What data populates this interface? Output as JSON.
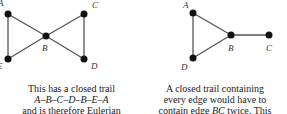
{
  "left_graph": {
    "vertices": [
      {
        "id": "A",
        "x": 8,
        "y": 14,
        "label_x": -2,
        "label_y": 6
      },
      {
        "id": "C",
        "x": 84,
        "y": 14,
        "label_x": 92,
        "label_y": 8
      },
      {
        "id": "B",
        "x": 46,
        "y": 36,
        "label_x": 42,
        "label_y": 51
      },
      {
        "id": "E",
        "x": 8,
        "y": 59,
        "label_x": -3,
        "label_y": 69
      },
      {
        "id": "D",
        "x": 84,
        "y": 59,
        "label_x": 91,
        "label_y": 69
      }
    ],
    "edges": [
      [
        "A",
        "B"
      ],
      [
        "A",
        "E"
      ],
      [
        "E",
        "B"
      ],
      [
        "B",
        "C"
      ],
      [
        "C",
        "D"
      ],
      [
        "B",
        "D"
      ]
    ],
    "caption": {
      "line1": "This has a closed trail",
      "line2": "A–B–C–D–B–E–A",
      "line3": "and is therefore Eulerian"
    }
  },
  "right_graph": {
    "vertices": [
      {
        "id": "A",
        "x": 193,
        "y": 13,
        "label_x": 183,
        "label_y": 8
      },
      {
        "id": "B",
        "x": 231,
        "y": 35,
        "label_x": 228,
        "label_y": 51
      },
      {
        "id": "C",
        "x": 269,
        "y": 35,
        "label_x": 266,
        "label_y": 51
      },
      {
        "id": "D",
        "x": 193,
        "y": 58,
        "label_x": 181,
        "label_y": 70
      }
    ],
    "edges": [
      [
        "A",
        "B"
      ],
      [
        "A",
        "D"
      ],
      [
        "D",
        "B"
      ],
      [
        "B",
        "C"
      ]
    ],
    "caption": {
      "line1": "A closed trail containing",
      "line2": "every edge would have to",
      "line3_pre": "contain edge ",
      "line3_it": "BC",
      "line3_post": " twice. This"
    }
  },
  "colors": {
    "edge": "#555555",
    "vertex": "#111111",
    "text": "#222222"
  }
}
